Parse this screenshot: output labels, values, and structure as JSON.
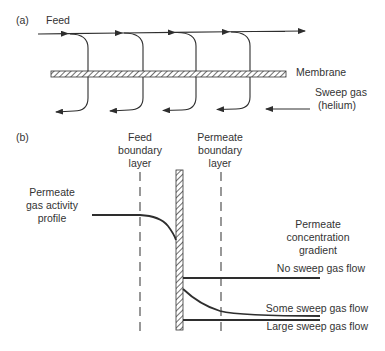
{
  "panel_a": {
    "label": "(a)",
    "feed_label": "Feed",
    "membrane_label": "Membrane",
    "sweep_label_line1": "Sweep gas",
    "sweep_label_line2": "(helium)"
  },
  "panel_b": {
    "label": "(b)",
    "feed_boundary_line1": "Feed",
    "feed_boundary_line2": "boundary",
    "feed_boundary_line3": "layer",
    "permeate_boundary_line1": "Permeate",
    "permeate_boundary_line2": "boundary",
    "permeate_boundary_line3": "layer",
    "activity_line1": "Permeate",
    "activity_line2": "gas activity",
    "activity_line3": "profile",
    "gradient_line1": "Permeate",
    "gradient_line2": "concentration",
    "gradient_line3": "gradient",
    "curves": [
      {
        "label": "No sweep gas flow"
      },
      {
        "label": "Some sweep gas flow"
      },
      {
        "label": "Large sweep gas flow"
      }
    ]
  }
}
